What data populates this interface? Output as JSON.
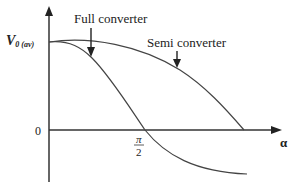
{
  "diagram": {
    "y_axis_label": "V",
    "y_axis_label_sub": "0 (av)",
    "x_axis_label": "α",
    "origin_label": "0",
    "tick_label_numerator": "π",
    "tick_label_denominator": "2",
    "curves": [
      {
        "name": "Full converter",
        "label": "Full converter",
        "description": "V0 ∝ cos α; crosses zero at α = π/2 and goes negative"
      },
      {
        "name": "Semi converter",
        "label": "Semi converter",
        "description": "V0 ∝ (1 + cos α)/2; reaches zero at α = π"
      }
    ],
    "colors": {
      "line": "#333333",
      "text": "#222222",
      "background": "#ffffff"
    }
  }
}
